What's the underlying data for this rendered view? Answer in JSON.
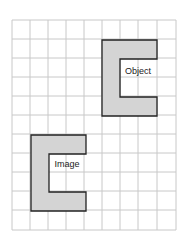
{
  "diagram": {
    "type": "grid-translation",
    "grid": {
      "columns": 9,
      "rows": 11,
      "line_color": "#c8c8c8"
    },
    "shape_fill": "#d4d4d4",
    "shape_stroke": "#222222",
    "shapes": [
      {
        "label": "Object",
        "cells_origin": [
          5,
          1
        ],
        "width_cells": 3,
        "height_cells": 4,
        "notch": "right"
      },
      {
        "label": "Image",
        "cells_origin": [
          1,
          6
        ],
        "width_cells": 3,
        "height_cells": 4,
        "notch": "right"
      }
    ]
  }
}
